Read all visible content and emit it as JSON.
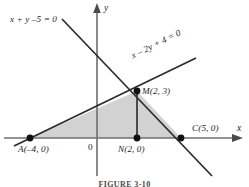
{
  "figure": {
    "caption": "FIGURE 3-10",
    "axes": {
      "x_label": "x",
      "y_label": "y",
      "origin_label": "0"
    },
    "lines": [
      {
        "id": "line-x-plus-y-minus-5",
        "equation": "x + y –5 = 0",
        "slope": -1,
        "intercept": 5
      },
      {
        "id": "line-x-minus-2y-plus-4",
        "equation": "x – 2y + 4 = 0",
        "slope": 0.5,
        "intercept": 2
      }
    ],
    "points": [
      {
        "id": "point-m",
        "label": "M(2, 3)",
        "x": 2,
        "y": 3
      },
      {
        "id": "point-a",
        "label": "A(–4, 0)",
        "x": -4,
        "y": 0
      },
      {
        "id": "point-n",
        "label": "N(2, 0)",
        "x": 2,
        "y": 0
      },
      {
        "id": "point-c",
        "label": "C(5, 0)",
        "x": 5,
        "y": 0
      }
    ],
    "shaded_region": {
      "id": "triangle-amc",
      "vertices": [
        "A(–4, 0)",
        "M(2, 3)",
        "C(5, 0)"
      ],
      "fill_color": "#d2d2d2"
    },
    "segment_mn": {
      "id": "segment-mn",
      "from": "M(2, 3)",
      "to": "N(2, 0)"
    },
    "colors": {
      "stroke": "#2b2b2b",
      "axis": "#6b6b6b",
      "shade": "#d2d2d2",
      "background": "#ffffff"
    }
  }
}
